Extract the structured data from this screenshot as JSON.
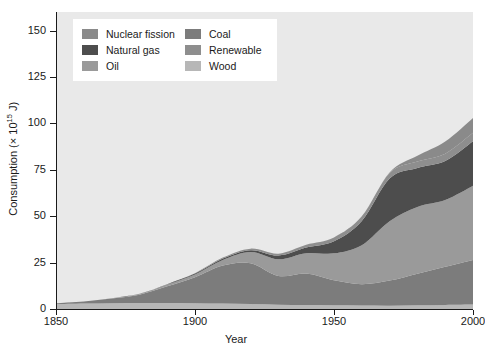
{
  "chart_data": {
    "type": "area",
    "title": "",
    "xlabel": "Year",
    "ylabel": "Consumption (× 10¹⁵ J)",
    "ylabel_main": "Consumption (× 10",
    "ylabel_exp": "15",
    "ylabel_tail": " J)",
    "xlim": [
      1850,
      2000
    ],
    "ylim": [
      0,
      160
    ],
    "grid": false,
    "stacked": true,
    "legend_position": "top-left",
    "xticks": [
      1850,
      1900,
      1950,
      2000
    ],
    "xtick_labels": [
      "1850",
      "1900",
      "1950",
      "2000"
    ],
    "yticks": [
      0,
      25,
      50,
      75,
      100,
      125,
      150
    ],
    "ytick_labels": [
      "0",
      "25",
      "50",
      "75",
      "100",
      "125",
      "150"
    ],
    "x": [
      1850,
      1860,
      1870,
      1880,
      1890,
      1900,
      1910,
      1920,
      1930,
      1940,
      1950,
      1960,
      1970,
      1980,
      1990,
      2000
    ],
    "series": [
      {
        "name": "Coal",
        "color": "#7c7c7c",
        "order": 1,
        "values": [
          0.5,
          1.2,
          2.5,
          4.5,
          9.0,
          14.0,
          20.5,
          22.0,
          15.5,
          17.0,
          13.5,
          11.5,
          13.5,
          17.0,
          20.5,
          24.0
        ]
      },
      {
        "name": "Oil",
        "color": "#9a9a9a",
        "order": 2,
        "values": [
          0.0,
          0.0,
          0.2,
          0.5,
          1.0,
          1.5,
          3.0,
          6.0,
          9.0,
          11.0,
          14.5,
          21.0,
          32.0,
          36.0,
          36.0,
          40.0
        ]
      },
      {
        "name": "Natural gas",
        "color": "#4d4d4d",
        "order": 3,
        "values": [
          0.0,
          0.0,
          0.0,
          0.0,
          0.2,
          0.5,
          0.8,
          1.0,
          2.0,
          3.0,
          6.5,
          13.0,
          23.0,
          21.0,
          21.0,
          24.0
        ]
      },
      {
        "name": "Renewable",
        "color": "#8e8e8e",
        "order": 4,
        "values": [
          0.0,
          0.0,
          0.0,
          0.0,
          0.0,
          0.2,
          0.5,
          0.8,
          1.0,
          1.5,
          2.0,
          2.5,
          3.0,
          3.5,
          4.0,
          4.5
        ]
      },
      {
        "name": "Nuclear fission",
        "color": "#8a8a8a",
        "order": 5,
        "values": [
          0.0,
          0.0,
          0.0,
          0.0,
          0.0,
          0.0,
          0.0,
          0.0,
          0.0,
          0.0,
          0.0,
          0.1,
          0.3,
          3.0,
          6.5,
          8.0
        ]
      },
      {
        "name": "Wood",
        "color": "#b7b7b7",
        "order": 0,
        "values": [
          2.6,
          2.9,
          3.1,
          3.2,
          3.2,
          3.1,
          2.9,
          2.7,
          2.3,
          2.1,
          2.0,
          1.9,
          1.8,
          2.0,
          2.2,
          2.4
        ]
      }
    ],
    "stack_order_bottom_to_top": [
      "Wood",
      "Coal",
      "Oil",
      "Natural gas",
      "Renewable",
      "Nuclear fission"
    ]
  },
  "legend": {
    "columns": [
      [
        {
          "label": "Nuclear fission",
          "color": "#8a8a8a"
        },
        {
          "label": "Natural gas",
          "color": "#4d4d4d"
        },
        {
          "label": "Oil",
          "color": "#9a9a9a"
        }
      ],
      [
        {
          "label": "Coal",
          "color": "#7c7c7c"
        },
        {
          "label": "Renewable",
          "color": "#8e8e8e"
        },
        {
          "label": "Wood",
          "color": "#b7b7b7"
        }
      ]
    ]
  },
  "style": {
    "panel_background": "#e9e9e9",
    "figure_background": "#ffffff",
    "axis_color": "#1a1a1a",
    "legend_background": "#ffffff"
  }
}
